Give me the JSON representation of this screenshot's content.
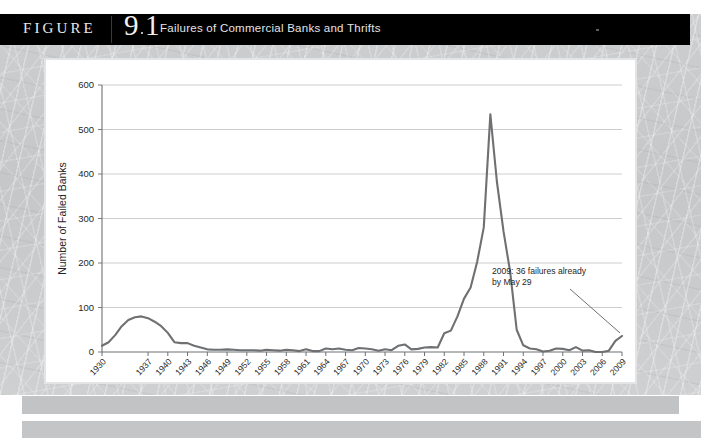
{
  "header": {
    "figure_word": "FIGURE",
    "figure_number": "9",
    "figure_subnumber": "1",
    "figure_dot": ".",
    "title": "Failures of Commercial Banks and Thrifts"
  },
  "chart_data": {
    "type": "line",
    "title": "Failures of Commercial Banks and Thrifts",
    "xlabel": "Year",
    "ylabel": "Number of Failed Banks",
    "ylim": [
      0,
      600
    ],
    "yticks": [
      0,
      100,
      200,
      300,
      400,
      500,
      600
    ],
    "grid": true,
    "legend": "none",
    "xtick_labels": [
      "1930",
      "1937",
      "1940",
      "1943",
      "1946",
      "1949",
      "1952",
      "1955",
      "1958",
      "1961",
      "1964",
      "1967",
      "1970",
      "1973",
      "1976",
      "1979",
      "1982",
      "1985",
      "1988",
      "1991",
      "1994",
      "1997",
      "2000",
      "2003",
      "2006",
      "2009"
    ],
    "annotations": [
      {
        "text_line1": "2009: 36 failures already",
        "text_line2": "by May 29",
        "points_to_year": 2009,
        "points_to_value": 36
      }
    ],
    "series": [
      {
        "name": "Failed banks and thrifts",
        "color": "#6f7072",
        "x": [
          1930,
          1931,
          1932,
          1933,
          1934,
          1935,
          1936,
          1937,
          1938,
          1939,
          1940,
          1941,
          1942,
          1943,
          1944,
          1945,
          1946,
          1947,
          1948,
          1949,
          1950,
          1951,
          1952,
          1953,
          1954,
          1955,
          1956,
          1957,
          1958,
          1959,
          1960,
          1961,
          1962,
          1963,
          1964,
          1965,
          1966,
          1967,
          1968,
          1969,
          1970,
          1971,
          1972,
          1973,
          1974,
          1975,
          1976,
          1977,
          1978,
          1979,
          1980,
          1981,
          1982,
          1983,
          1984,
          1985,
          1986,
          1987,
          1988,
          1989,
          1990,
          1991,
          1992,
          1993,
          1994,
          1995,
          1996,
          1997,
          1998,
          1999,
          2000,
          2001,
          2002,
          2003,
          2004,
          2005,
          2006,
          2007,
          2008,
          2009
        ],
        "values": [
          14,
          22,
          38,
          58,
          72,
          78,
          80,
          76,
          68,
          58,
          43,
          22,
          20,
          20,
          14,
          10,
          6,
          5,
          5,
          6,
          5,
          4,
          4,
          4,
          3,
          5,
          4,
          3,
          5,
          4,
          2,
          6,
          2,
          2,
          8,
          6,
          8,
          5,
          4,
          9,
          8,
          6,
          3,
          6,
          4,
          14,
          17,
          6,
          7,
          10,
          11,
          10,
          42,
          48,
          80,
          120,
          145,
          203,
          280,
          534,
          382,
          271,
          181,
          50,
          15,
          8,
          6,
          1,
          3,
          8,
          7,
          4,
          11,
          3,
          4,
          0,
          0,
          3,
          25,
          36
        ]
      }
    ]
  },
  "icons": {
    "header_speck": "speck-icon"
  }
}
